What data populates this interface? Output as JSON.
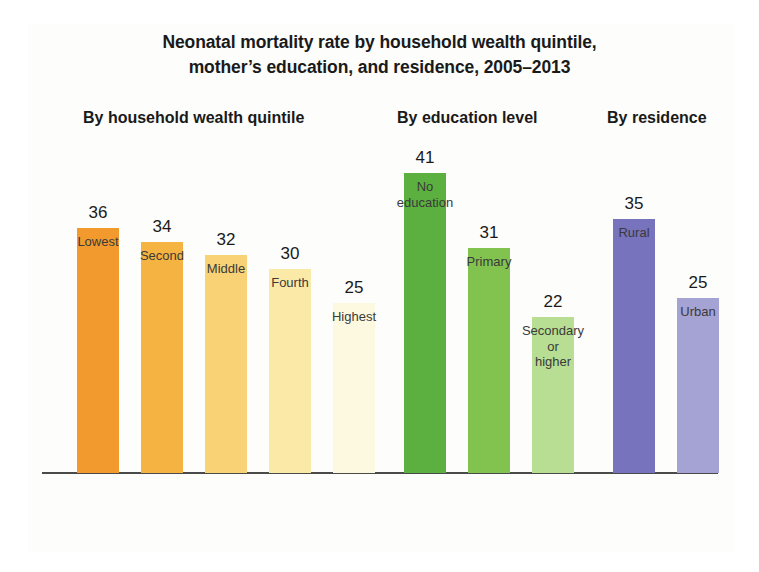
{
  "title": {
    "line1": "Neonatal mortality rate by household wealth quintile,",
    "line2": "mother’s education, and residence, 2005–2013"
  },
  "groups": {
    "wealth_heading": "By household wealth quintile",
    "education_heading": "By education level",
    "residence_heading": "By residence"
  },
  "chart_data": {
    "type": "bar",
    "title": "Neonatal mortality rate by household wealth quintile, mother’s education, and residence, 2005–2013",
    "xlabel": "",
    "ylabel": "",
    "ylim": [
      0,
      41
    ],
    "grid": false,
    "legend": "none",
    "axis_line": true,
    "value_labels": true,
    "groups": [
      {
        "name": "By household wealth quintile",
        "categories": [
          "Lowest",
          "Second",
          "Middle",
          "Fourth",
          "Highest"
        ],
        "values": [
          36,
          34,
          32,
          30,
          25
        ],
        "colors": [
          "#f29a2e",
          "#f5b441",
          "#f8d274",
          "#fbe9a8",
          "#fdf8e0"
        ]
      },
      {
        "name": "By education level",
        "categories": [
          "No education",
          "Primary",
          "Secondary or higher"
        ],
        "values": [
          41,
          31,
          22
        ],
        "colors": [
          "#5cb040",
          "#82c350",
          "#b7de92"
        ]
      },
      {
        "name": "By residence",
        "categories": [
          "Rural",
          "Urban"
        ],
        "values": [
          35,
          25
        ],
        "colors": [
          "#7773bc",
          "#a5a2d4"
        ]
      }
    ]
  },
  "bars": [
    {
      "label_lines": [
        "Lowest"
      ],
      "value": "36",
      "x": 77,
      "color": "#f29a2e",
      "h": 245
    },
    {
      "label_lines": [
        "Second"
      ],
      "value": "34",
      "x": 141,
      "color": "#f5b441",
      "h": 231
    },
    {
      "label_lines": [
        "Middle"
      ],
      "value": "32",
      "x": 205,
      "color": "#f8d274",
      "h": 218
    },
    {
      "label_lines": [
        "Fourth"
      ],
      "value": "30",
      "x": 269,
      "color": "#fbe9a8",
      "h": 204
    },
    {
      "label_lines": [
        "Highest"
      ],
      "value": "25",
      "x": 333,
      "color": "#fdf8e0",
      "h": 170
    },
    {
      "label_lines": [
        "No",
        "education"
      ],
      "value": "41",
      "x": 404,
      "color": "#5cb040",
      "h": 300
    },
    {
      "label_lines": [
        "Primary"
      ],
      "value": "31",
      "x": 468,
      "color": "#82c350",
      "h": 225
    },
    {
      "label_lines": [
        "Secondary",
        "or",
        "higher"
      ],
      "value": "22",
      "x": 532,
      "color": "#b7de92",
      "h": 156
    },
    {
      "label_lines": [
        "Rural"
      ],
      "value": "35",
      "x": 613,
      "color": "#7773bc",
      "h": 254
    },
    {
      "label_lines": [
        "Urban"
      ],
      "value": "25",
      "x": 677,
      "color": "#a5a2d4",
      "h": 175
    }
  ]
}
